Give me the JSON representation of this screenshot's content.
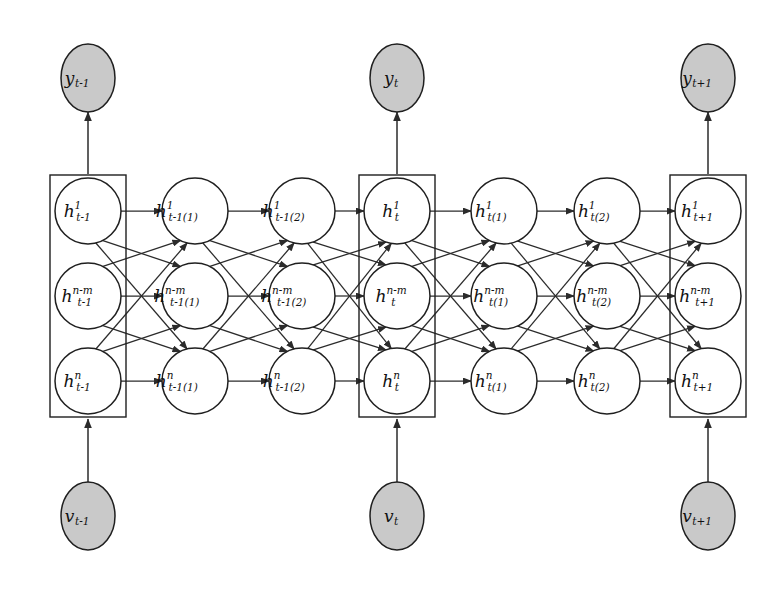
{
  "figure": {
    "background_color": "#ffffff",
    "shaded_node_color": "#c9c9c9",
    "hidden_node_color": "#ffffff",
    "stroke_color": "#1f1f1f"
  },
  "chart_data": {
    "type": "diagram",
    "layout": "7 hidden columns x 3 hidden units, with shaded observed input (v) and output (y) nodes at three boxed time steps",
    "time_steps": [
      "t-1",
      "t",
      "t+1"
    ],
    "hidden_units_per_column": 3,
    "unit_superscripts": [
      "1",
      "n-m",
      "n"
    ],
    "columns": [
      {
        "index": 0,
        "boxed": true,
        "time": "t-1",
        "center_x": 88,
        "nodes": [
          {
            "base": "h",
            "sup": "1",
            "sub": "t-1"
          },
          {
            "base": "h",
            "sup": "n-m",
            "sub": "t-1"
          },
          {
            "base": "h",
            "sup": "n",
            "sub": "t-1"
          }
        ]
      },
      {
        "index": 1,
        "boxed": false,
        "time": "t-1(1)",
        "center_x": 195,
        "nodes": [
          {
            "base": "h",
            "sup": "1",
            "sub": "t-1(1)"
          },
          {
            "base": "h",
            "sup": "n-m",
            "sub": "t-1(1)"
          },
          {
            "base": "h",
            "sup": "n",
            "sub": "t-1(1)"
          }
        ]
      },
      {
        "index": 2,
        "boxed": false,
        "time": "t-1(2)",
        "center_x": 302,
        "nodes": [
          {
            "base": "h",
            "sup": "1",
            "sub": "t-1(2)"
          },
          {
            "base": "h",
            "sup": "n-m",
            "sub": "t-1(2)"
          },
          {
            "base": "h",
            "sup": "n",
            "sub": "t-1(2)"
          }
        ]
      },
      {
        "index": 3,
        "boxed": true,
        "time": "t",
        "center_x": 397,
        "nodes": [
          {
            "base": "h",
            "sup": "1",
            "sub": "t"
          },
          {
            "base": "h",
            "sup": "n-m",
            "sub": "t"
          },
          {
            "base": "h",
            "sup": "n",
            "sub": "t"
          }
        ]
      },
      {
        "index": 4,
        "boxed": false,
        "time": "t(1)",
        "center_x": 504,
        "nodes": [
          {
            "base": "h",
            "sup": "1",
            "sub": "t(1)"
          },
          {
            "base": "h",
            "sup": "n-m",
            "sub": "t(1)"
          },
          {
            "base": "h",
            "sup": "n",
            "sub": "t(1)"
          }
        ]
      },
      {
        "index": 5,
        "boxed": false,
        "time": "t(2)",
        "center_x": 607,
        "nodes": [
          {
            "base": "h",
            "sup": "1",
            "sub": "t(2)"
          },
          {
            "base": "h",
            "sup": "n-m",
            "sub": "t(2)"
          },
          {
            "base": "h",
            "sup": "n",
            "sub": "t(2)"
          }
        ]
      },
      {
        "index": 6,
        "boxed": true,
        "time": "t+1",
        "center_x": 708,
        "nodes": [
          {
            "base": "h",
            "sup": "1",
            "sub": "t+1"
          },
          {
            "base": "h",
            "sup": "n-m",
            "sub": "t+1"
          },
          {
            "base": "h",
            "sup": "n",
            "sub": "t+1"
          }
        ]
      }
    ],
    "output_nodes": [
      {
        "base": "y",
        "sub": "t-1",
        "center_x": 88,
        "center_y": 78,
        "shaded": true
      },
      {
        "base": "y",
        "sub": "t",
        "center_x": 397,
        "center_y": 78,
        "shaded": true
      },
      {
        "base": "y",
        "sub": "t+1",
        "center_x": 708,
        "center_y": 78,
        "shaded": true
      }
    ],
    "input_nodes": [
      {
        "base": "v",
        "sub": "t-1",
        "center_x": 88,
        "center_y": 516,
        "shaded": true
      },
      {
        "base": "v",
        "sub": "t",
        "center_x": 397,
        "center_y": 516,
        "shaded": true
      },
      {
        "base": "v",
        "sub": "t+1",
        "center_x": 708,
        "center_y": 516,
        "shaded": true
      }
    ],
    "edges": {
      "between_columns": "fully connected (3 x 3 = 9 directed arrows) from each column to the next",
      "input_to_hidden": "v_time -> boxed hidden column (upward arrow)",
      "hidden_to_output": "boxed hidden column -> y_time (upward arrow)",
      "direction": "left to right / bottom to top"
    },
    "row_y_positions": [
      211,
      296,
      381
    ],
    "circle_radius": 33,
    "io_ellipse_rx": 27,
    "io_ellipse_ry": 34
  }
}
